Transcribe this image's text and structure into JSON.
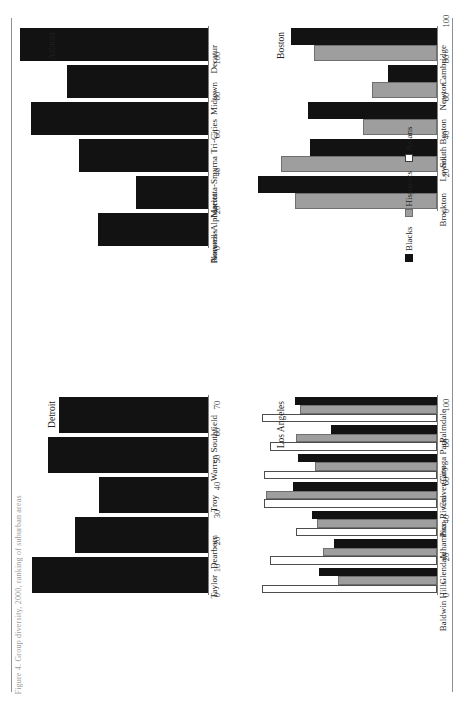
{
  "figure": {
    "caption": "Figure 4. Group diversity, 2000, ranking of suburban areas",
    "legend": {
      "position": "bottom-right",
      "entries": [
        {
          "label": "Blacks",
          "swatch": "filled-black",
          "color": "#121212"
        },
        {
          "label": "Hispanics",
          "swatch": "filled-gray",
          "color": "#9e9e9e"
        },
        {
          "label": "Asians",
          "swatch": "outline-white",
          "color": "#ffffff"
        }
      ]
    }
  },
  "chart_data": [
    {
      "type": "bar",
      "title": "Atlanta",
      "panel": "top-left",
      "orientation": "horizontal",
      "categories": [
        "Decatur",
        "Midtown",
        "Tri-Cities",
        "Marietta-Smyrna",
        "Roswell-Alpharetta",
        "Norcross"
      ],
      "series": [
        {
          "name": "Blacks",
          "color": "#121212",
          "values": [
            99,
            74,
            93,
            68,
            38,
            58
          ]
        }
      ],
      "xlabel": "",
      "ylabel": "",
      "ylim": [
        0,
        100
      ],
      "yticks": [
        0,
        20,
        40,
        60,
        80,
        100
      ],
      "grid": false
    },
    {
      "type": "bar",
      "title": "Boston",
      "panel": "top-right",
      "orientation": "horizontal",
      "categories": [
        "Cambridge",
        "Newton",
        "South Boston",
        "Lowell",
        "Brockton"
      ],
      "series": [
        {
          "name": "Blacks",
          "color": "#121212",
          "values": [
            77,
            26,
            68,
            67,
            94
          ]
        },
        {
          "name": "Hispanics",
          "color": "#9e9e9e",
          "values": [
            65,
            34,
            39,
            82,
            75
          ]
        }
      ],
      "xlabel": "",
      "ylabel": "",
      "ylim": [
        0,
        100
      ],
      "yticks": [
        0,
        20,
        40,
        60,
        80,
        100
      ],
      "grid": false
    },
    {
      "type": "bar",
      "title": "Detroit",
      "panel": "bottom-left",
      "orientation": "horizontal",
      "categories": [
        "Southfield",
        "Warren",
        "Troy",
        "Dearborn",
        "Taylor"
      ],
      "series": [
        {
          "name": "Blacks",
          "color": "#121212",
          "values": [
            55,
            59,
            40,
            49,
            65
          ]
        }
      ],
      "xlabel": "",
      "ylabel": "",
      "ylim": [
        0,
        70
      ],
      "yticks": [
        0,
        10,
        20,
        30,
        40,
        50,
        60,
        70
      ],
      "grid": false
    },
    {
      "type": "bar",
      "title": "Los Angeles",
      "panel": "bottom-right",
      "orientation": "horizontal",
      "categories": [
        "Palmdale",
        "Canoga Park",
        "Culver City",
        "Pico Rivera",
        "Alhambra",
        "Glendale",
        "Baldwin Hills"
      ],
      "series": [
        {
          "name": "Blacks",
          "color": "#121212",
          "values": [
            75,
            56,
            73,
            76,
            66,
            54,
            62
          ]
        },
        {
          "name": "Hispanics",
          "color": "#9e9e9e",
          "values": [
            72,
            74,
            64,
            90,
            63,
            60,
            52
          ]
        },
        {
          "name": "Asians",
          "color": "#ffffff",
          "values": [
            92,
            88,
            91,
            91,
            74,
            88,
            92
          ]
        }
      ],
      "xlabel": "",
      "ylabel": "",
      "ylim": [
        0,
        100
      ],
      "yticks": [
        0,
        20,
        40,
        60,
        80,
        100
      ],
      "grid": false
    }
  ]
}
